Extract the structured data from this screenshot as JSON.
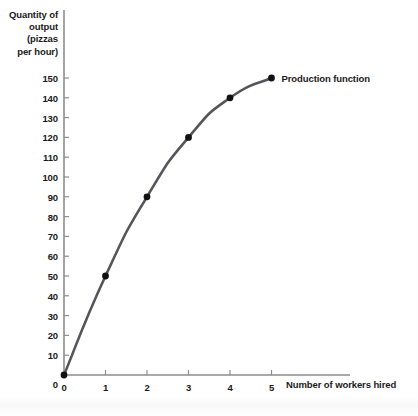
{
  "chart_data": {
    "type": "line",
    "title": "",
    "xlabel": "Number of workers hired",
    "ylabel": "Quantity of\noutput\n(pizzas\nper hour)",
    "xlim": [
      0,
      5
    ],
    "ylim": [
      0,
      150
    ],
    "grid": false,
    "legend_position": "inline-right",
    "x": [
      0,
      1,
      2,
      3,
      4,
      5
    ],
    "series": [
      {
        "name": "Production function",
        "values": [
          0,
          50,
          90,
          120,
          140,
          150
        ],
        "color": "#55555a",
        "marker": "circle",
        "marker_color": "#111111"
      }
    ],
    "xticks": [
      0,
      1,
      2,
      3,
      4,
      5
    ],
    "xtick_labels": [
      "0",
      "1",
      "2",
      "3",
      "4",
      "5"
    ],
    "yticks": [
      0,
      10,
      20,
      30,
      40,
      50,
      60,
      70,
      80,
      90,
      100,
      110,
      120,
      130,
      140,
      150
    ],
    "ytick_labels": [
      "0",
      "10",
      "20",
      "30",
      "40",
      "50",
      "60",
      "70",
      "80",
      "90",
      "100",
      "110",
      "120",
      "130",
      "140",
      "150"
    ],
    "annotations": [
      {
        "text": "Production function",
        "x": 5,
        "y": 150
      }
    ],
    "colors": {
      "axis": "#8d8d8d",
      "line": "#55555a",
      "marker": "#111111",
      "text": "#1a1a1a",
      "background": "#ffffff"
    }
  },
  "geometry": {
    "origin_x": 64,
    "origin_y": 375,
    "x_unit": 41.5,
    "y_per_10": 19.8,
    "y_axis_top": 10,
    "x_axis_right": 350,
    "tick_len": 5,
    "marker_radius": 3.4,
    "line_width": 2.6,
    "axis_width": 1.6
  }
}
